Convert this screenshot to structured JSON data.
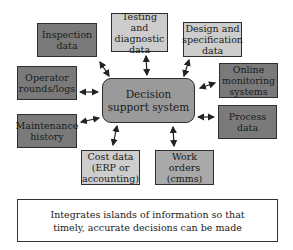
{
  "diagram": {
    "center": {
      "label": "Decision\nsupport system"
    },
    "nodes": [
      {
        "id": "inspection",
        "label": "Inspection\ndata",
        "shade": "dark"
      },
      {
        "id": "testing",
        "label": "Testing and\ndiagnostic\ndata",
        "shade": "light"
      },
      {
        "id": "design",
        "label": "Design and\nspecification\ndata",
        "shade": "light"
      },
      {
        "id": "operator",
        "label": "Operator\nrounds/logs",
        "shade": "dark"
      },
      {
        "id": "online",
        "label": "Online\nmonitoring\nsystems",
        "shade": "dark"
      },
      {
        "id": "maintenance",
        "label": "Maintenance\nhistory",
        "shade": "dark"
      },
      {
        "id": "process",
        "label": "Process\ndata",
        "shade": "dark"
      },
      {
        "id": "cost",
        "label": "Cost data\n(ERP or\naccounting)",
        "shade": "light"
      },
      {
        "id": "workorders",
        "label": "Work\norders\n(cmms)",
        "shade": "mid"
      }
    ],
    "edges": [
      {
        "from": "inspection",
        "to": "center",
        "type": "bidirectional"
      },
      {
        "from": "testing",
        "to": "center",
        "type": "bidirectional"
      },
      {
        "from": "design",
        "to": "center",
        "type": "bidirectional"
      },
      {
        "from": "operator",
        "to": "center",
        "type": "bidirectional"
      },
      {
        "from": "online",
        "to": "center",
        "type": "bidirectional"
      },
      {
        "from": "maintenance",
        "to": "center",
        "type": "bidirectional"
      },
      {
        "from": "process",
        "to": "center",
        "type": "bidirectional"
      },
      {
        "from": "cost",
        "to": "center",
        "type": "bidirectional"
      },
      {
        "from": "workorders",
        "to": "center",
        "type": "bidirectional"
      }
    ],
    "caption": "Integrates islands of information so that\ntimely, accurate decisions can be made",
    "colors": {
      "dark": "#7a7a7a",
      "light": "#cdcdcd",
      "mid": "#a9a9a9",
      "center": "#9a9a9a",
      "border": "#2e2e2e"
    }
  }
}
